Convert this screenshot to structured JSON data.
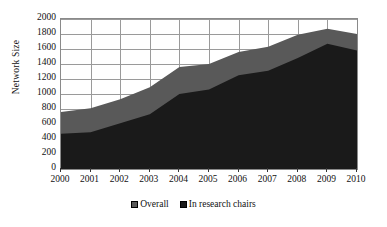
{
  "chart_data": {
    "type": "area",
    "title": "",
    "subtitle": "",
    "xlabel": "",
    "ylabel": "Network Size",
    "categories": [
      "2000",
      "2001",
      "2002",
      "2003",
      "2004",
      "2005",
      "2006",
      "2007",
      "2008",
      "2009",
      "2010"
    ],
    "x": [
      2000,
      2001,
      2002,
      2003,
      2004,
      2005,
      2006,
      2007,
      2008,
      2009,
      2010
    ],
    "series": [
      {
        "name": "Overall",
        "color": "#595959",
        "values": [
          760,
          810,
          930,
          1090,
          1360,
          1400,
          1560,
          1630,
          1790,
          1870,
          1800
        ]
      },
      {
        "name": "In research chairs",
        "color": "#1a1a1a",
        "values": [
          470,
          490,
          610,
          730,
          1000,
          1060,
          1250,
          1310,
          1480,
          1670,
          1580
        ]
      }
    ],
    "stacked": false,
    "overlay": true,
    "ylim": [
      0,
      2000
    ],
    "ytick_step": 200,
    "yticks": [
      0,
      200,
      400,
      600,
      800,
      1000,
      1200,
      1400,
      1600,
      1800,
      2000
    ],
    "xlim": [
      2000,
      2010
    ],
    "grid": true,
    "grid_color": "#9a9a9a",
    "legend_position": "bottom",
    "legend": [
      {
        "label": "Overall",
        "color": "#595959"
      },
      {
        "label": "In research chairs",
        "color": "#1a1a1a"
      }
    ],
    "annotations": [],
    "background": "#ffffff"
  }
}
